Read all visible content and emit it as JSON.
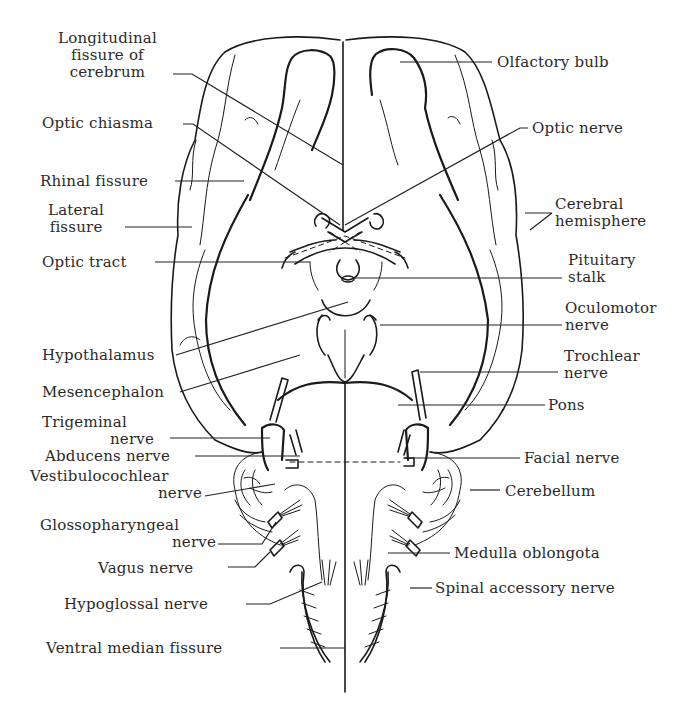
{
  "figure": {
    "ink_color": "#1a1a1a",
    "background_color": "#ffffff"
  },
  "labels_left": {
    "longitudinal_fissure": {
      "line1": "Longitudinal",
      "line2": "fissure of",
      "line3": "cerebrum"
    },
    "optic_chiasma": "Optic chiasma",
    "rhinal_fissure": "Rhinal fissure",
    "lateral_fissure": {
      "line1": "Lateral",
      "line2": "fissure"
    },
    "optic_tract": "Optic tract",
    "hypothalamus": "Hypothalamus",
    "mesencephalon": "Mesencephalon",
    "trigeminal_nerve": {
      "line1": "Trigeminal",
      "line2": "nerve"
    },
    "abducens_nerve": "Abducens nerve",
    "vestibulocochlear_nerve": {
      "line1": "Vestibulocochlear",
      "line2": "nerve"
    },
    "glossopharyngeal_nerve": {
      "line1": "Glossopharyngeal",
      "line2": "nerve"
    },
    "vagus_nerve": "Vagus nerve",
    "hypoglossal_nerve": "Hypoglossal nerve",
    "ventral_median_fissure": "Ventral median fissure"
  },
  "labels_right": {
    "olfactory_bulb": "Olfactory bulb",
    "optic_nerve": "Optic nerve",
    "cerebral_hemisphere": {
      "line1": "Cerebral",
      "line2": "hemisphere"
    },
    "pituitary_stalk": {
      "line1": "Pituitary",
      "line2": "stalk"
    },
    "oculomotor_nerve": {
      "line1": "Oculomotor",
      "line2": "nerve"
    },
    "trochlear_nerve": {
      "line1": "Trochlear",
      "line2": "nerve"
    },
    "pons": "Pons",
    "facial_nerve": "Facial nerve",
    "cerebellum": "Cerebellum",
    "medulla_oblongata": "Medulla oblongota",
    "spinal_accessory_nerve": "Spinal accessory nerve"
  }
}
